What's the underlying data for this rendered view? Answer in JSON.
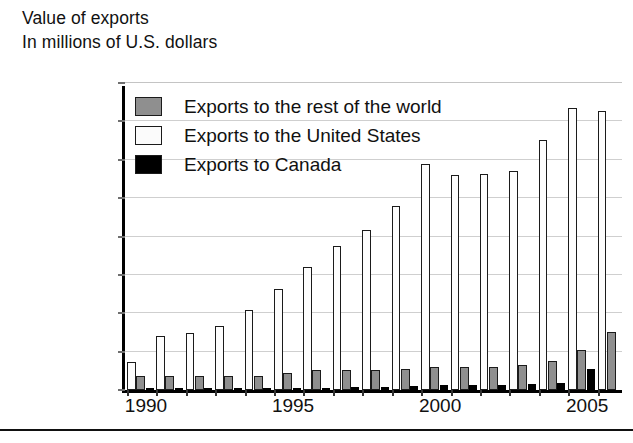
{
  "header": {
    "title": "Value of exports",
    "subtitle": "In millions of U.S. dollars"
  },
  "legend": {
    "position": "top-left-inside",
    "items": [
      {
        "label": "Exports to the rest of the world",
        "color": "#8f8f8f",
        "swatch": "gray-swatch"
      },
      {
        "label": "Exports to the United States",
        "color": "#fbfbfb",
        "swatch": "white-swatch"
      },
      {
        "label": "Exports to Canada",
        "color": "#000000",
        "swatch": "black-swatch"
      }
    ]
  },
  "axes": {
    "y_ticks": [
      "200,000",
      "175,000",
      "150,000",
      "125,000",
      "100,000",
      "75,000",
      "50,000",
      "25,000",
      "0"
    ],
    "x_ticks": [
      "1990",
      "1995",
      "2000",
      "2005"
    ]
  },
  "chart_data": {
    "type": "bar",
    "title": "Value of exports",
    "subtitle": "In millions of U.S. dollars",
    "xlabel": "",
    "ylabel": "In millions of U.S. dollars",
    "ylim": [
      0,
      200000
    ],
    "ytick_step": 25000,
    "grid": true,
    "legend_position": "top-left-inside",
    "categories": [
      "1990",
      "1991",
      "1992",
      "1993",
      "1994",
      "1995",
      "1996",
      "1997",
      "1998",
      "1999",
      "2000",
      "2001",
      "2002",
      "2003",
      "2004",
      "2005",
      "2006"
    ],
    "labelled_xticks": [
      "1990",
      "1995",
      "2000",
      "2005"
    ],
    "series": [
      {
        "name": "Exports to the United States",
        "color": "#fbfbfb",
        "values": [
          18000,
          35000,
          37000,
          42000,
          52000,
          66000,
          80000,
          94000,
          104000,
          120000,
          147000,
          140000,
          141000,
          143000,
          163000,
          184000,
          182000
        ]
      },
      {
        "name": "Exports to the rest of the world",
        "color": "#8f8f8f",
        "values": [
          9000,
          9000,
          9000,
          9000,
          9000,
          11000,
          13000,
          13000,
          13000,
          14000,
          15000,
          15000,
          15000,
          16000,
          19000,
          26000,
          38000
        ]
      },
      {
        "name": "Exports to Canada",
        "color": "#000000",
        "values": [
          700,
          800,
          900,
          900,
          1000,
          1200,
          1500,
          1800,
          2200,
          2600,
          3000,
          3200,
          3400,
          3800,
          4500,
          14000,
          0
        ]
      }
    ]
  }
}
